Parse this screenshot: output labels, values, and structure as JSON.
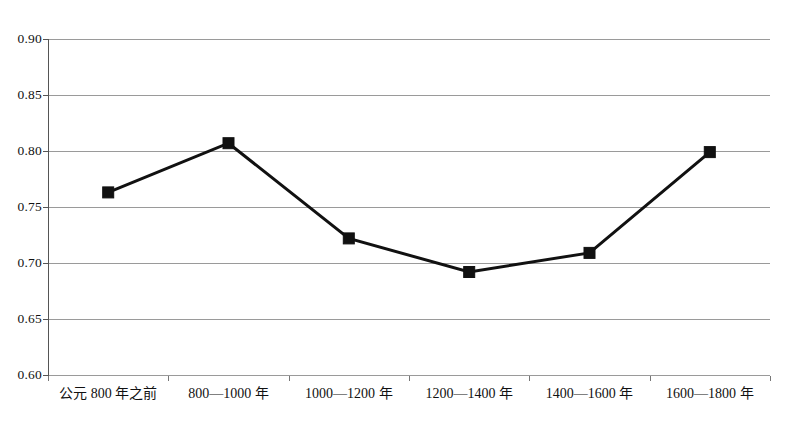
{
  "chart_data": {
    "type": "line",
    "title": "",
    "subtitle": "",
    "xlabel": "",
    "ylabel": "",
    "categories": [
      "公元 800 年之前",
      "800—1000 年",
      "1000—1200 年",
      "1200—1400 年",
      "1400—1600 年",
      "1600—1800 年"
    ],
    "values": [
      0.763,
      0.807,
      0.722,
      0.692,
      0.709,
      0.799
    ],
    "series": [
      {
        "name": "",
        "values": [
          0.763,
          0.807,
          0.722,
          0.692,
          0.709,
          0.799
        ]
      }
    ],
    "ylim": [
      0.6,
      0.9
    ],
    "ytick_labels": [
      "0.90",
      "0.85",
      "0.80",
      "0.75",
      "0.70",
      "0.65",
      "0.60"
    ],
    "ytick_values": [
      0.9,
      0.85,
      0.8,
      0.75,
      0.7,
      0.65,
      0.6
    ],
    "grid": true,
    "grid_axis": "y",
    "legend": false,
    "legend_position": "none",
    "marker": "square",
    "marker_color": "#111111",
    "line_color": "#111111",
    "gridline_color": "#9a9a9a",
    "background_color": "#ffffff",
    "annotations": []
  }
}
